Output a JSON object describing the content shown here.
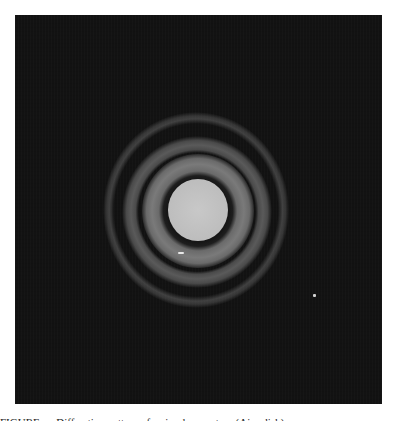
{
  "figure": {
    "background_color": "#121212",
    "disk_color": "#c8c8c8",
    "ring_color": "#6a6a6a",
    "rings_visible": 3
  },
  "caption": {
    "text": "FIGURE — Diffraction pattern of a circular aperture (Airy disk)"
  }
}
